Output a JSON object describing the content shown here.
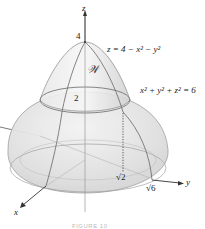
{
  "figure": {
    "axes": {
      "x_label": "x",
      "y_label": "y",
      "z_label": "z"
    },
    "z_ticks": [
      "4",
      "2"
    ],
    "y_ticks": [
      "√2",
      "√6"
    ],
    "region_label": "𝒲",
    "surfaces": {
      "paraboloid_equation": "z = 4 − x² − y²",
      "sphere_equation": "x² + y² + z² = 6"
    },
    "caption": "FIGURE 10",
    "colors": {
      "surface_fill": "#e4e4e4",
      "surface_edge": "#8a8a8a",
      "axis": "#333333",
      "text": "#222222"
    }
  }
}
